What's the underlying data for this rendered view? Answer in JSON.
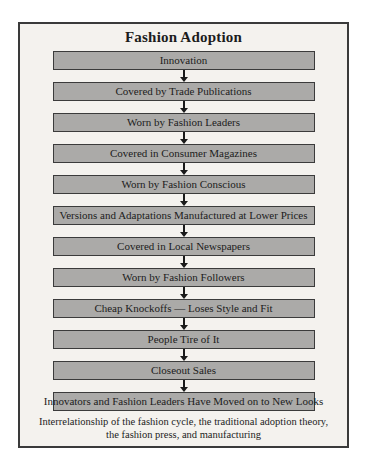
{
  "title": "Fashion Adoption",
  "flow": {
    "steps": [
      "Innovation",
      "Covered by Trade Publications",
      "Worn by Fashion Leaders",
      "Covered in Consumer Magazines",
      "Worn by Fashion Conscious",
      "Versions and Adaptations Manufactured at Lower Prices",
      "Covered in Local Newspapers",
      "Worn by Fashion Followers",
      "Cheap Knockoffs — Loses Style and Fit",
      "People Tire of It",
      "Closeout Sales",
      "Innovators and Fashion Leaders Have Moved on to New Looks"
    ]
  },
  "caption": {
    "line1": "Interrelationship of the fashion cycle, the traditional adoption theory,",
    "line2": "the fashion press, and manufacturing"
  },
  "colors": {
    "panel_bg": "#f4f2ee",
    "panel_border": "#3a3a3a",
    "box_fill": "#abaaa8",
    "box_border": "#3b3b3b",
    "arrow": "#1a1a1a"
  }
}
